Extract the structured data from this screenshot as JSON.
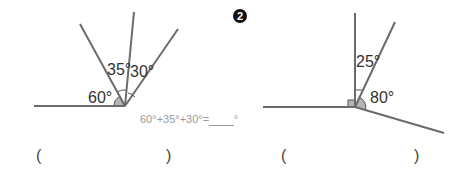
{
  "problems": [
    {
      "number": "",
      "angles": {
        "left": "60°",
        "middle": "35°",
        "right": "30°"
      },
      "formula": "60°+35°+30°=",
      "formula_blank": "____",
      "formula_unit": "°",
      "answer": {
        "open": "(",
        "value": "",
        "close": ")"
      }
    },
    {
      "number": "2",
      "angles": {
        "upper": "25°",
        "right": "80°"
      },
      "answer": {
        "open": "(",
        "value": "",
        "close": ")"
      }
    }
  ],
  "colors": {
    "line": "#6b6b6b",
    "arc_fill": "#b5b5b5",
    "text": "#333333",
    "formula": "#9a9a9a"
  }
}
